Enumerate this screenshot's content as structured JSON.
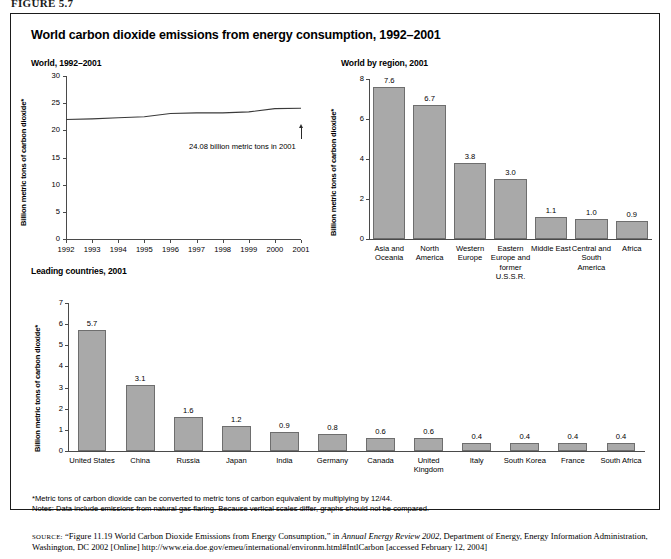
{
  "figure_label": "FIGURE 5.7",
  "title": "World carbon dioxide emissions from energy consumption, 1992–2001",
  "panels": {
    "line": {
      "subtitle": "World, 1992–2001"
    },
    "region": {
      "subtitle": "World by region, 2001"
    },
    "countries": {
      "subtitle": "Leading countries, 2001"
    }
  },
  "footnotes": {
    "asterisk": "*Metric tons of carbon dioxide can be converted to metric tons of carbon equivalent by multiplying by 12/44.",
    "notes": "Notes: Data include emissions from natural gas flaring. Because vertical scales differ, graphs should not be compared."
  },
  "source": {
    "label": "SOURCE:",
    "part1": "“Figure 11.19 World Carbon Dioxide Emissions from Energy Consumption,” in ",
    "italic": "Annual Energy Review 2002",
    "part2": ", Department of Energy, Energy Information Administration, Washington, DC 2002 [Online] http://www.eia.doe.gov/emeu/international/environm.html#IntlCarbon [accessed February 12, 2004]"
  },
  "colors": {
    "bar_fill": "#a9a9a9",
    "bar_stroke": "#6e6e6e",
    "axis": "#4a4a4a",
    "frame": "#1b1b1b"
  },
  "chart_data": [
    {
      "id": "world-line",
      "type": "line",
      "title": "World, 1992–2001",
      "xlabel": "",
      "ylabel": "Billion metric tons of carbon dioxide*",
      "ylim": [
        0,
        30
      ],
      "yticks": [
        0,
        5,
        10,
        15,
        20,
        25,
        30
      ],
      "grid": false,
      "legend": "none",
      "x": [
        1992,
        1993,
        1994,
        1995,
        1996,
        1997,
        1998,
        1999,
        2000,
        2001
      ],
      "values": [
        22.0,
        22.1,
        22.3,
        22.5,
        23.1,
        23.2,
        23.2,
        23.4,
        24.0,
        24.08
      ],
      "annotation": "24.08 billion metric tons in 2001"
    },
    {
      "id": "by-region",
      "type": "bar",
      "title": "World by region, 2001",
      "xlabel": "",
      "ylabel": "Billion metric tons of carbon dioxide*",
      "ylim": [
        0,
        8
      ],
      "yticks": [
        0,
        2,
        4,
        6,
        8
      ],
      "grid": false,
      "legend": "none",
      "categories": [
        "Asia and Oceania",
        "North America",
        "Western Europe",
        "Eastern Europe and former U.S.S.R.",
        "Middle East",
        "Central and South America",
        "Africa"
      ],
      "values": [
        7.6,
        6.7,
        3.8,
        3.0,
        1.1,
        1.0,
        0.9
      ]
    },
    {
      "id": "leading-countries",
      "type": "bar",
      "title": "Leading countries, 2001",
      "xlabel": "",
      "ylabel": "Billion metric tons of carbon dioxide*",
      "ylim": [
        0,
        7
      ],
      "yticks": [
        0,
        1,
        2,
        3,
        4,
        5,
        6,
        7
      ],
      "grid": false,
      "legend": "none",
      "categories": [
        "United States",
        "China",
        "Russia",
        "Japan",
        "India",
        "Germany",
        "Canada",
        "United Kingdom",
        "Italy",
        "South Korea",
        "France",
        "South Africa"
      ],
      "values": [
        5.7,
        3.1,
        1.6,
        1.2,
        0.9,
        0.8,
        0.6,
        0.6,
        0.4,
        0.4,
        0.4,
        0.4
      ]
    }
  ]
}
